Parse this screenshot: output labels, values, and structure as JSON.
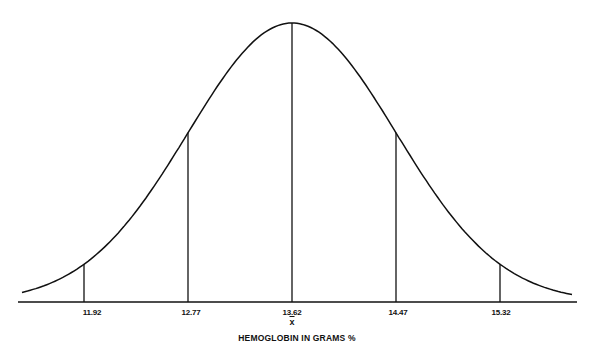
{
  "chart_data": {
    "type": "line",
    "subtype": "normal-distribution-curve",
    "title": "",
    "xlabel": "HEMOGLOBIN IN GRAMS %",
    "ylabel": "",
    "mean": 13.62,
    "mean_symbol": "x",
    "std_dev": 0.85,
    "tick_labels": [
      "11.92",
      "12.77",
      "13.62",
      "14.47",
      "15.32"
    ],
    "x": [
      11.92,
      12.77,
      13.62,
      14.47,
      15.32
    ],
    "vertical_lines_at": [
      11.92,
      12.77,
      13.62,
      14.47,
      15.32
    ],
    "grid": false,
    "legend": null,
    "colors": {
      "line": "#111111",
      "background": "#ffffff"
    }
  },
  "labels": {
    "ticks": [
      "11.92",
      "12.77",
      "13.62",
      "14.47",
      "15.32"
    ],
    "mean_symbol": "x",
    "xaxis_title": "HEMOGLOBIN IN GRAMS %"
  }
}
